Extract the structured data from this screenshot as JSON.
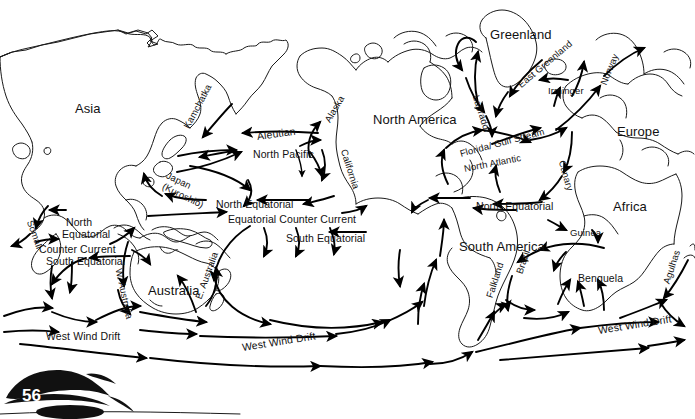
{
  "page": {
    "number": "56"
  },
  "continents": [
    {
      "name": "Asia",
      "label": "Asia",
      "x": 75,
      "y": 101
    },
    {
      "name": "North America",
      "label": "North America",
      "x": 373,
      "y": 112
    },
    {
      "name": "South America",
      "label": "South America",
      "x": 459,
      "y": 239
    },
    {
      "name": "Europe",
      "label": "Europe",
      "x": 617,
      "y": 124
    },
    {
      "name": "Africa",
      "label": "Africa",
      "x": 613,
      "y": 199
    },
    {
      "name": "Greenland",
      "label": "Greenland",
      "x": 490,
      "y": 27
    },
    {
      "name": "Australia",
      "label": "Australia",
      "x": 148,
      "y": 283
    }
  ],
  "currents": [
    {
      "name": "kamchatka",
      "label": "Kamchatka",
      "x": 186,
      "y": 122,
      "rot": -62,
      "size": "sm"
    },
    {
      "name": "aleutian",
      "label": "Aleutian",
      "x": 257,
      "y": 130,
      "rot": -8,
      "size": "normal"
    },
    {
      "name": "north-pacific",
      "label": "North Pacific",
      "x": 253,
      "y": 148,
      "rot": 0,
      "size": "normal"
    },
    {
      "name": "alaska",
      "label": "Alaska",
      "x": 327,
      "y": 116,
      "rot": -60,
      "size": "sm"
    },
    {
      "name": "california",
      "label": "California",
      "x": 344,
      "y": 144,
      "rot": 72,
      "size": "sm"
    },
    {
      "name": "japan-kuroshio",
      "label": "Japan",
      "x": 167,
      "y": 169,
      "rot": 26,
      "size": "sm"
    },
    {
      "name": "japan-kuroshio-alt",
      "label": "(Kuroshio)",
      "x": 163,
      "y": 180,
      "rot": 26,
      "size": "sm"
    },
    {
      "name": "north-equatorial-pacific",
      "label": "North Equatorial",
      "x": 216,
      "y": 198,
      "rot": 0,
      "size": "normal"
    },
    {
      "name": "equatorial-counter-current",
      "label": "Equatorial Counter Current",
      "x": 228,
      "y": 213,
      "rot": 0,
      "size": "normal"
    },
    {
      "name": "south-equatorial-pacific",
      "label": "South Equatorial",
      "x": 286,
      "y": 232,
      "rot": 0,
      "size": "normal"
    },
    {
      "name": "somali",
      "label": "Somali",
      "x": 30,
      "y": 215,
      "rot": 70,
      "size": "sm"
    },
    {
      "name": "north-equatorial-indian",
      "label": "North",
      "x": 66,
      "y": 216,
      "rot": 0,
      "size": "normal"
    },
    {
      "name": "north-equatorial-indian-2",
      "label": "Equatorial",
      "x": 62,
      "y": 228,
      "rot": 0,
      "size": "normal"
    },
    {
      "name": "counter-current-indian",
      "label": "Counter Current",
      "x": 39,
      "y": 243,
      "rot": 0,
      "size": "normal"
    },
    {
      "name": "south-equatorial-indian",
      "label": "South Equatorial",
      "x": 46,
      "y": 255,
      "rot": 0,
      "size": "normal"
    },
    {
      "name": "west-australia",
      "label": "W. Australia",
      "x": 119,
      "y": 263,
      "rot": 78,
      "size": "sm"
    },
    {
      "name": "east-australia",
      "label": "E. Australia",
      "x": 198,
      "y": 293,
      "rot": -70,
      "size": "sm"
    },
    {
      "name": "west-wind-drift-indian",
      "label": "West Wind Drift",
      "x": 46,
      "y": 330,
      "rot": 0,
      "size": "normal"
    },
    {
      "name": "west-wind-drift-pacific",
      "label": "West Wind Drift",
      "x": 242,
      "y": 341,
      "rot": -9,
      "size": "normal"
    },
    {
      "name": "west-wind-drift-atlantic",
      "label": "West Wind Drift",
      "x": 598,
      "y": 324,
      "rot": -9,
      "size": "normal"
    },
    {
      "name": "labrador",
      "label": "Labrador",
      "x": 476,
      "y": 90,
      "rot": 72,
      "size": "sm"
    },
    {
      "name": "east-greenland",
      "label": "East Greenland",
      "x": 519,
      "y": 80,
      "rot": -40,
      "size": "sm"
    },
    {
      "name": "irminger",
      "label": "Irminger",
      "x": 548,
      "y": 85,
      "rot": 0,
      "size": "sm"
    },
    {
      "name": "norway",
      "label": "Norway",
      "x": 603,
      "y": 79,
      "rot": -68,
      "size": "sm"
    },
    {
      "name": "florida-gulf-stream",
      "label": "Florida/ Gulf Stream",
      "x": 460,
      "y": 148,
      "rot": -15,
      "size": "sm"
    },
    {
      "name": "north-atlantic",
      "label": "North Atlantic",
      "x": 464,
      "y": 163,
      "rot": -11,
      "size": "sm"
    },
    {
      "name": "canary",
      "label": "Canary",
      "x": 562,
      "y": 155,
      "rot": 74,
      "size": "sm"
    },
    {
      "name": "north-equatorial-atlantic",
      "label": "North Equatorial",
      "x": 476,
      "y": 200,
      "rot": 0,
      "size": "normal"
    },
    {
      "name": "guinea",
      "label": "Guinea",
      "x": 570,
      "y": 227,
      "rot": 0,
      "size": "sm"
    },
    {
      "name": "brazil",
      "label": "Brazil",
      "x": 519,
      "y": 268,
      "rot": -72,
      "size": "sm"
    },
    {
      "name": "falkland",
      "label": "Falkland",
      "x": 489,
      "y": 292,
      "rot": -72,
      "size": "sm"
    },
    {
      "name": "benguela",
      "label": "Benguela",
      "x": 578,
      "y": 272,
      "rot": 0,
      "size": "normal"
    },
    {
      "name": "agulhas",
      "label": "Agulhas",
      "x": 666,
      "y": 278,
      "rot": -72,
      "size": "sm"
    }
  ],
  "colors": {
    "ink": "#111111",
    "coastline": "#1a1a1a",
    "background": "#ffffff",
    "page_number_fill": "#ffffff"
  }
}
